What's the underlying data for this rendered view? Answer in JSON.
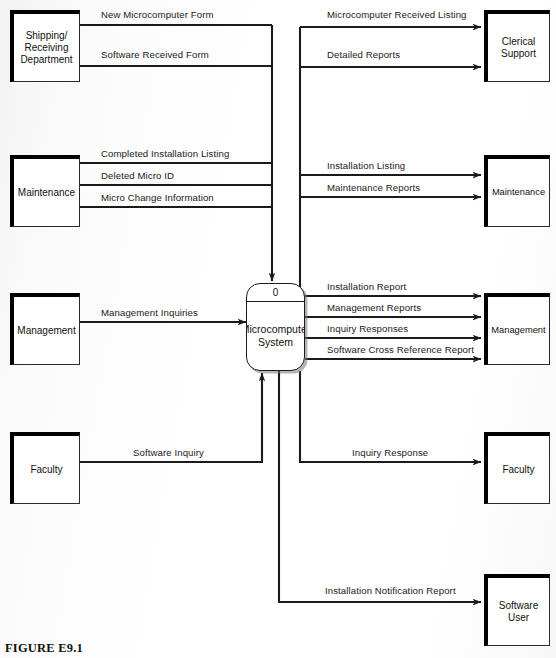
{
  "figure": {
    "caption": "FIGURE E9.1"
  },
  "process": {
    "number": "0",
    "name": "Microcomputer\nSystem"
  },
  "entities": [
    {
      "id": "shipping-receiving-department",
      "label": "Shipping/\nReceiving\nDepartment",
      "side": "left",
      "x": 10,
      "y": 10,
      "w": 70,
      "h": 72,
      "font": 10
    },
    {
      "id": "maintenance-left",
      "label": "Maintenance",
      "side": "left",
      "x": 10,
      "y": 155,
      "w": 70,
      "h": 72,
      "font": 10
    },
    {
      "id": "management-left",
      "label": "Management",
      "side": "left",
      "x": 10,
      "y": 293,
      "w": 70,
      "h": 72,
      "font": 10
    },
    {
      "id": "faculty-left",
      "label": "Faculty",
      "side": "left",
      "x": 10,
      "y": 432,
      "w": 70,
      "h": 72,
      "font": 10
    },
    {
      "id": "clerical-support",
      "label": "Clerical\nSupport",
      "side": "right",
      "x": 484,
      "y": 10,
      "w": 66,
      "h": 72,
      "font": 10
    },
    {
      "id": "maintenance-right",
      "label": "Maintenance",
      "side": "right",
      "x": 484,
      "y": 155,
      "w": 66,
      "h": 72,
      "font": 9.3
    },
    {
      "id": "management-right",
      "label": "Management",
      "side": "right",
      "x": 484,
      "y": 293,
      "w": 66,
      "h": 72,
      "font": 9.3
    },
    {
      "id": "faculty-right",
      "label": "Faculty",
      "side": "right",
      "x": 484,
      "y": 432,
      "w": 66,
      "h": 72,
      "font": 10
    },
    {
      "id": "software-user",
      "label": "Software\nUser",
      "side": "right",
      "x": 484,
      "y": 574,
      "w": 66,
      "h": 72,
      "font": 10
    }
  ],
  "flows": [
    {
      "id": "new-microcomputer-form",
      "label": "New Microcomputer Form",
      "x": 101,
      "y": 9,
      "direction": "in"
    },
    {
      "id": "software-received-form",
      "label": "Software Received Form",
      "x": 101,
      "y": 49,
      "direction": "in"
    },
    {
      "id": "microcomputer-received-listing",
      "label": "Microcomputer Received Listing",
      "x": 327,
      "y": 9,
      "direction": "out"
    },
    {
      "id": "detailed-reports",
      "label": "Detailed Reports",
      "x": 327,
      "y": 49,
      "direction": "out"
    },
    {
      "id": "completed-installation-listing",
      "label": "Completed Installation Listing",
      "x": 101,
      "y": 148,
      "direction": "in"
    },
    {
      "id": "deleted-micro-id",
      "label": "Deleted Micro ID",
      "x": 101,
      "y": 170,
      "direction": "in"
    },
    {
      "id": "micro-change-information",
      "label": "Micro Change Information",
      "x": 101,
      "y": 192,
      "direction": "in"
    },
    {
      "id": "installation-listing",
      "label": "Installation Listing",
      "x": 327,
      "y": 160,
      "direction": "out"
    },
    {
      "id": "maintenance-reports",
      "label": "Maintenance Reports",
      "x": 327,
      "y": 182,
      "direction": "out"
    },
    {
      "id": "management-inquiries",
      "label": "Management Inquiries",
      "x": 101,
      "y": 307,
      "direction": "in"
    },
    {
      "id": "installation-report",
      "label": "Installation Report",
      "x": 327,
      "y": 281,
      "direction": "out"
    },
    {
      "id": "management-reports",
      "label": "Management Reports",
      "x": 327,
      "y": 302,
      "direction": "out"
    },
    {
      "id": "inquiry-responses",
      "label": "Inquiry Responses",
      "x": 327,
      "y": 323,
      "direction": "out"
    },
    {
      "id": "software-cross-reference-report",
      "label": "Software Cross Reference Report",
      "x": 327,
      "y": 344,
      "direction": "out"
    },
    {
      "id": "software-inquiry",
      "label": "Software Inquiry",
      "x": 133,
      "y": 447,
      "direction": "in"
    },
    {
      "id": "inquiry-response",
      "label": "Inquiry Response",
      "x": 352,
      "y": 447,
      "direction": "out"
    },
    {
      "id": "installation-notification-report",
      "label": "Installation Notification Report",
      "x": 325,
      "y": 585,
      "direction": "out"
    }
  ],
  "colors": {
    "line": "#1b1b1b",
    "entity_shadow": "#000000",
    "paper": "#fdfdfd"
  }
}
